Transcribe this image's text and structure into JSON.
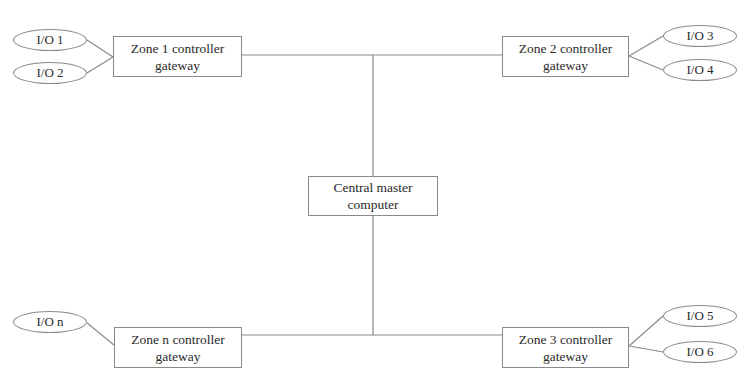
{
  "diagram": {
    "type": "network-topology",
    "colors": {
      "line": "#8a8a8a",
      "text": "#2a2a2a",
      "background": "#ffffff"
    },
    "central": {
      "line1": "Central master",
      "line2": "computer"
    },
    "zones": [
      {
        "id": "zone1",
        "line1": "Zone 1 controller",
        "line2": "gateway",
        "io": [
          "I/O 1",
          "I/O 2"
        ]
      },
      {
        "id": "zone2",
        "line1": "Zone 2 controller",
        "line2": "gateway",
        "io": [
          "I/O 3",
          "I/O 4"
        ]
      },
      {
        "id": "zonen",
        "line1": "Zone n controller",
        "line2": "gateway",
        "io": [
          "I/O n"
        ]
      },
      {
        "id": "zone3",
        "line1": "Zone 3 controller",
        "line2": "gateway",
        "io": [
          "I/O 5",
          "I/O 6"
        ]
      }
    ]
  }
}
